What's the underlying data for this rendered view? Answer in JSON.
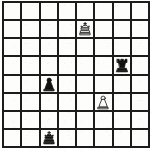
{
  "board": {
    "title": "Chess position diagram",
    "files": [
      "a",
      "b",
      "c",
      "d",
      "e",
      "f",
      "g",
      "h"
    ],
    "ranks": [
      "8",
      "7",
      "6",
      "5",
      "4",
      "3",
      "2",
      "1"
    ],
    "size": 8,
    "colors": {
      "square_light": "#fdfdfb",
      "square_dark": "#fdfdfb",
      "grid_line": "#1c1c1c",
      "piece_black": "#111111",
      "piece_white_fill": "#fdfdfb",
      "piece_white_outline": "#111111",
      "page_background": "#ffffff"
    },
    "orientation": "white-bottom",
    "coordinates_shown": false,
    "squares": [
      {
        "square": "a8",
        "row": 1,
        "col": 1,
        "piece": null,
        "piece_name": "empty-square"
      },
      {
        "square": "b8",
        "row": 1,
        "col": 2,
        "piece": null,
        "piece_name": "empty-square"
      },
      {
        "square": "c8",
        "row": 1,
        "col": 3,
        "piece": null,
        "piece_name": "empty-square"
      },
      {
        "square": "d8",
        "row": 1,
        "col": 4,
        "piece": null,
        "piece_name": "empty-square"
      },
      {
        "square": "e8",
        "row": 1,
        "col": 5,
        "piece": null,
        "piece_name": "empty-square"
      },
      {
        "square": "f8",
        "row": 1,
        "col": 6,
        "piece": null,
        "piece_name": "empty-square"
      },
      {
        "square": "g8",
        "row": 1,
        "col": 7,
        "piece": null,
        "piece_name": "empty-square"
      },
      {
        "square": "h8",
        "row": 1,
        "col": 8,
        "piece": null,
        "piece_name": "empty-square"
      },
      {
        "square": "a7",
        "row": 2,
        "col": 1,
        "piece": null,
        "piece_name": "empty-square"
      },
      {
        "square": "b7",
        "row": 2,
        "col": 2,
        "piece": null,
        "piece_name": "empty-square"
      },
      {
        "square": "c7",
        "row": 2,
        "col": 3,
        "piece": null,
        "piece_name": "empty-square"
      },
      {
        "square": "d7",
        "row": 2,
        "col": 4,
        "piece": null,
        "piece_name": "empty-square"
      },
      {
        "square": "e7",
        "row": 2,
        "col": 5,
        "piece": "white-king",
        "piece_name": "white-king-piece",
        "glyph": "♔"
      },
      {
        "square": "f7",
        "row": 2,
        "col": 6,
        "piece": null,
        "piece_name": "empty-square"
      },
      {
        "square": "g7",
        "row": 2,
        "col": 7,
        "piece": null,
        "piece_name": "empty-square"
      },
      {
        "square": "h7",
        "row": 2,
        "col": 8,
        "piece": null,
        "piece_name": "empty-square"
      },
      {
        "square": "a6",
        "row": 3,
        "col": 1,
        "piece": null,
        "piece_name": "empty-square"
      },
      {
        "square": "b6",
        "row": 3,
        "col": 2,
        "piece": null,
        "piece_name": "empty-square"
      },
      {
        "square": "c6",
        "row": 3,
        "col": 3,
        "piece": null,
        "piece_name": "empty-square"
      },
      {
        "square": "d6",
        "row": 3,
        "col": 4,
        "piece": null,
        "piece_name": "empty-square"
      },
      {
        "square": "e6",
        "row": 3,
        "col": 5,
        "piece": null,
        "piece_name": "empty-square"
      },
      {
        "square": "f6",
        "row": 3,
        "col": 6,
        "piece": null,
        "piece_name": "empty-square"
      },
      {
        "square": "g6",
        "row": 3,
        "col": 7,
        "piece": null,
        "piece_name": "empty-square"
      },
      {
        "square": "h6",
        "row": 3,
        "col": 8,
        "piece": null,
        "piece_name": "empty-square"
      },
      {
        "square": "a5",
        "row": 4,
        "col": 1,
        "piece": null,
        "piece_name": "empty-square"
      },
      {
        "square": "b5",
        "row": 4,
        "col": 2,
        "piece": null,
        "piece_name": "empty-square"
      },
      {
        "square": "c5",
        "row": 4,
        "col": 3,
        "piece": null,
        "piece_name": "empty-square"
      },
      {
        "square": "d5",
        "row": 4,
        "col": 4,
        "piece": null,
        "piece_name": "empty-square"
      },
      {
        "square": "e5",
        "row": 4,
        "col": 5,
        "piece": null,
        "piece_name": "empty-square"
      },
      {
        "square": "f5",
        "row": 4,
        "col": 6,
        "piece": null,
        "piece_name": "empty-square"
      },
      {
        "square": "g5",
        "row": 4,
        "col": 7,
        "piece": "black-rook",
        "piece_name": "black-rook-piece",
        "glyph": "♜"
      },
      {
        "square": "h5",
        "row": 4,
        "col": 8,
        "piece": null,
        "piece_name": "empty-square"
      },
      {
        "square": "a4",
        "row": 5,
        "col": 1,
        "piece": null,
        "piece_name": "empty-square"
      },
      {
        "square": "b4",
        "row": 5,
        "col": 2,
        "piece": null,
        "piece_name": "empty-square"
      },
      {
        "square": "c4",
        "row": 5,
        "col": 3,
        "piece": "black-pawn",
        "piece_name": "black-pawn-piece",
        "glyph": "♟"
      },
      {
        "square": "d4",
        "row": 5,
        "col": 4,
        "piece": null,
        "piece_name": "empty-square"
      },
      {
        "square": "e4",
        "row": 5,
        "col": 5,
        "piece": null,
        "piece_name": "empty-square"
      },
      {
        "square": "f4",
        "row": 5,
        "col": 6,
        "piece": null,
        "piece_name": "empty-square"
      },
      {
        "square": "g4",
        "row": 5,
        "col": 7,
        "piece": null,
        "piece_name": "empty-square"
      },
      {
        "square": "h4",
        "row": 5,
        "col": 8,
        "piece": null,
        "piece_name": "empty-square"
      },
      {
        "square": "a3",
        "row": 6,
        "col": 1,
        "piece": null,
        "piece_name": "empty-square"
      },
      {
        "square": "b3",
        "row": 6,
        "col": 2,
        "piece": null,
        "piece_name": "empty-square"
      },
      {
        "square": "c3",
        "row": 6,
        "col": 3,
        "piece": null,
        "piece_name": "empty-square"
      },
      {
        "square": "d3",
        "row": 6,
        "col": 4,
        "piece": null,
        "piece_name": "empty-square"
      },
      {
        "square": "e3",
        "row": 6,
        "col": 5,
        "piece": null,
        "piece_name": "empty-square"
      },
      {
        "square": "f3",
        "row": 6,
        "col": 6,
        "piece": "white-pawn",
        "piece_name": "white-pawn-piece",
        "glyph": "♙"
      },
      {
        "square": "g3",
        "row": 6,
        "col": 7,
        "piece": null,
        "piece_name": "empty-square"
      },
      {
        "square": "h3",
        "row": 6,
        "col": 8,
        "piece": null,
        "piece_name": "empty-square"
      },
      {
        "square": "a2",
        "row": 7,
        "col": 1,
        "piece": null,
        "piece_name": "empty-square"
      },
      {
        "square": "b2",
        "row": 7,
        "col": 2,
        "piece": null,
        "piece_name": "empty-square"
      },
      {
        "square": "c2",
        "row": 7,
        "col": 3,
        "piece": null,
        "piece_name": "empty-square"
      },
      {
        "square": "d2",
        "row": 7,
        "col": 4,
        "piece": null,
        "piece_name": "empty-square"
      },
      {
        "square": "e2",
        "row": 7,
        "col": 5,
        "piece": null,
        "piece_name": "empty-square"
      },
      {
        "square": "f2",
        "row": 7,
        "col": 6,
        "piece": null,
        "piece_name": "empty-square"
      },
      {
        "square": "g2",
        "row": 7,
        "col": 7,
        "piece": null,
        "piece_name": "empty-square"
      },
      {
        "square": "h2",
        "row": 7,
        "col": 8,
        "piece": null,
        "piece_name": "empty-square"
      },
      {
        "square": "a1",
        "row": 8,
        "col": 1,
        "piece": null,
        "piece_name": "empty-square"
      },
      {
        "square": "b1",
        "row": 8,
        "col": 2,
        "piece": null,
        "piece_name": "empty-square"
      },
      {
        "square": "c1",
        "row": 8,
        "col": 3,
        "piece": "black-king",
        "piece_name": "black-king-piece",
        "glyph": "♚"
      },
      {
        "square": "d1",
        "row": 8,
        "col": 4,
        "piece": null,
        "piece_name": "empty-square"
      },
      {
        "square": "e1",
        "row": 8,
        "col": 5,
        "piece": null,
        "piece_name": "empty-square"
      },
      {
        "square": "f1",
        "row": 8,
        "col": 6,
        "piece": null,
        "piece_name": "empty-square"
      },
      {
        "square": "g1",
        "row": 8,
        "col": 7,
        "piece": null,
        "piece_name": "empty-square"
      },
      {
        "square": "h1",
        "row": 8,
        "col": 8,
        "piece": null,
        "piece_name": "empty-square"
      }
    ],
    "piece_inventory": {
      "white": [
        {
          "piece": "white-king",
          "square": "e7"
        },
        {
          "piece": "white-pawn",
          "square": "f3"
        }
      ],
      "black": [
        {
          "piece": "black-rook",
          "square": "g5"
        },
        {
          "piece": "black-pawn",
          "square": "c4"
        },
        {
          "piece": "black-king",
          "square": "c1"
        }
      ]
    }
  }
}
